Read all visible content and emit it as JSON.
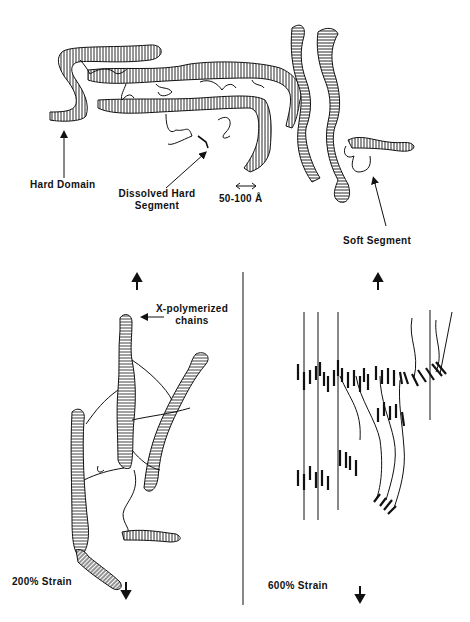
{
  "figure": {
    "panels": [
      {
        "id": "unstrained",
        "description": "Hard domains and soft segments in unstretched polymer"
      },
      {
        "id": "strain-200",
        "strain_label": "200%  Strain"
      },
      {
        "id": "strain-600",
        "strain_label": "600%  Strain"
      }
    ],
    "labels": {
      "hard_domain": "Hard  Domain",
      "dissolved_line1": "Dissolved Hard",
      "dissolved_line2": "Segment",
      "scale": "50-100  Å",
      "soft_segment": "Soft  Segment",
      "x_poly_line1": "X-polymerized",
      "x_poly_line2": "chains",
      "strain_200": "200%  Strain",
      "strain_600": "600%  Strain"
    },
    "colors": {
      "ink": "#111111",
      "background": "#ffffff"
    }
  }
}
